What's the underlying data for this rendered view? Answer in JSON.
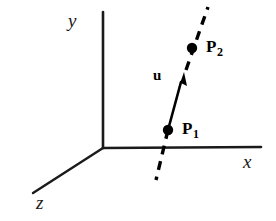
{
  "figure": {
    "background_color": "#ffffff",
    "stroke_color": "#1a1a1a",
    "width": 276,
    "height": 221
  },
  "axes": {
    "origin": {
      "x": 103,
      "y": 148
    },
    "items": [
      {
        "name": "y-axis",
        "label": "y",
        "from": {
          "x": 103,
          "y": 148
        },
        "to": {
          "x": 103,
          "y": 12
        }
      },
      {
        "name": "x-axis",
        "label": "x",
        "from": {
          "x": 103,
          "y": 148
        },
        "to": {
          "x": 261,
          "y": 147
        }
      },
      {
        "name": "z-axis",
        "label": "z",
        "from": {
          "x": 103,
          "y": 148
        },
        "to": {
          "x": 33,
          "y": 193
        }
      }
    ]
  },
  "line": {
    "name": "dashed-line-through-points",
    "style": "dashed",
    "from": {
      "x": 156,
      "y": 180
    },
    "to": {
      "x": 208,
      "y": 7
    },
    "dash_pattern": "9 7"
  },
  "vector": {
    "name": "u",
    "label": "u",
    "style": "solid-arrow",
    "tail": {
      "x": 168,
      "y": 130
    },
    "head": {
      "x": 183,
      "y": 74
    }
  },
  "points": [
    {
      "name": "P1",
      "label": "P",
      "subscript": "1",
      "x": 168,
      "y": 130,
      "radius": 5
    },
    {
      "name": "P2",
      "label": "P",
      "subscript": "2",
      "x": 192,
      "y": 48,
      "radius": 5
    }
  ]
}
